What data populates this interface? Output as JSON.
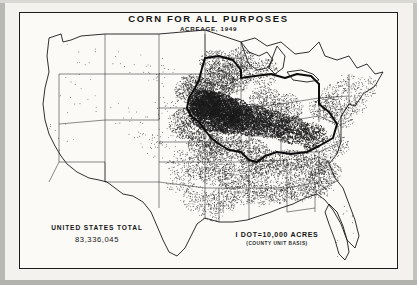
{
  "map": {
    "title": "CORN FOR ALL PURPOSES",
    "subtitle": "ACREAGE, 1949",
    "totals_label": "UNITED STATES TOTAL",
    "totals_value": "83,336,045",
    "legend_primary": "I DOT=10,000 ACRES",
    "legend_secondary": "(COUNTY UNIT BASIS)",
    "projection": "conterminous-united-states",
    "symbolization": "dot-density",
    "ink_color": "#1b1b1b",
    "paper_color": "#fbfaf7",
    "frame_color": "#1d1d1d"
  },
  "chart_data": {
    "type": "map",
    "title": "CORN FOR ALL PURPOSES",
    "subtitle": "ACREAGE, 1949",
    "unit": "acres",
    "dot_value": 10000,
    "enumeration_unit": "county",
    "national_total": 83336045,
    "legend_position": "bottom-right",
    "regions": [
      {
        "name": "Corn Belt core (Iowa, Illinois, E Nebraska, N Missouri, Indiana, Ohio)",
        "density": "very-high",
        "outlined": true
      },
      {
        "name": "Great Plains (Kansas, S Dakota, Minnesota)",
        "density": "high"
      },
      {
        "name": "Upper Midwest (Wisconsin, Michigan)",
        "density": "medium"
      },
      {
        "name": "Southeast (Georgia, Alabama, Tennessee, Carolinas, Kentucky)",
        "density": "medium"
      },
      {
        "name": "Mid-Atlantic / Northeast (Pennsylvania, New York, Virginia)",
        "density": "medium-low"
      },
      {
        "name": "South Central (E Texas, Oklahoma, Arkansas, Louisiana, Mississippi)",
        "density": "medium"
      },
      {
        "name": "Mountain West (Nevada, Utah, Idaho, Montana, Wyoming, Arizona)",
        "density": "very-low"
      },
      {
        "name": "Pacific (California, Oregon, Washington)",
        "density": "very-low"
      },
      {
        "name": "Florida peninsula",
        "density": "very-low"
      },
      {
        "name": "West Texas / New Mexico",
        "density": "very-low"
      }
    ]
  }
}
